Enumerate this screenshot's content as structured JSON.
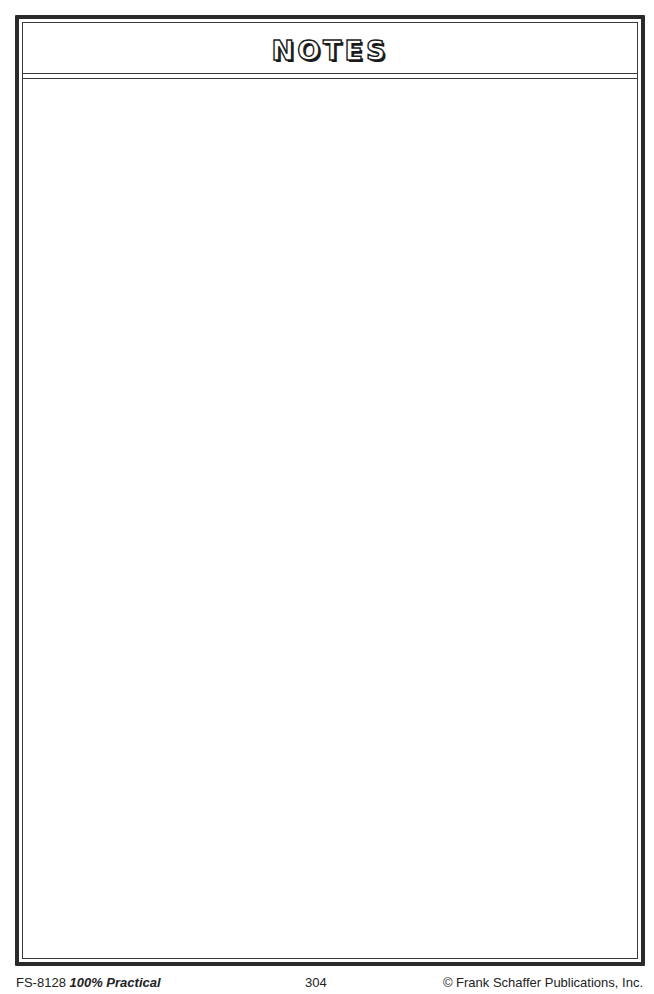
{
  "page": {
    "title": "NOTES",
    "notes_area": ""
  },
  "footer": {
    "code": "FS-8128",
    "book_title": "100% Practical",
    "page_number": "304",
    "copyright": "© Frank Schaffer Publications, Inc."
  },
  "colors": {
    "border": "#2a2a2a",
    "background": "#ffffff"
  }
}
